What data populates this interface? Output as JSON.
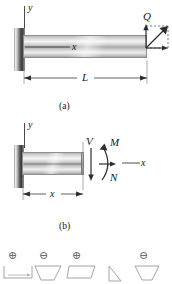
{
  "figure": {
    "type": "engineering-mechanics-diagram",
    "width": 172,
    "height": 284,
    "background_color": "#ffffff",
    "line_color": "#4a4a4a"
  },
  "panel_a": {
    "caption": "(a)",
    "axis_y_label": "y",
    "axis_x_label": "x",
    "load_label": "Q",
    "length_label": "L",
    "support": "fixed-wall",
    "description": "Cantilever beam fixed at left wall, length L, oblique load Q applied at free right end"
  },
  "panel_b": {
    "caption": "(b)",
    "axis_y_label": "y",
    "axis_x_label": "x",
    "shear_label": "V",
    "moment_label": "M",
    "normal_label": "N",
    "distance_label": "x",
    "description": "Free-body of beam segment cut at distance x showing internal shear V, bending moment M and normal force N"
  },
  "sign_convention_row": {
    "items": [
      {
        "sign": "⊕",
        "shape": "rect-positive"
      },
      {
        "sign": "⊖",
        "shape": "trapezoid-negative"
      },
      {
        "sign": "⊕",
        "shape": "parallelogram-positive"
      },
      {
        "sign": "",
        "shape": "wedge-plain"
      },
      {
        "sign": "⊖",
        "shape": "trapezoid-negative-2"
      }
    ]
  }
}
